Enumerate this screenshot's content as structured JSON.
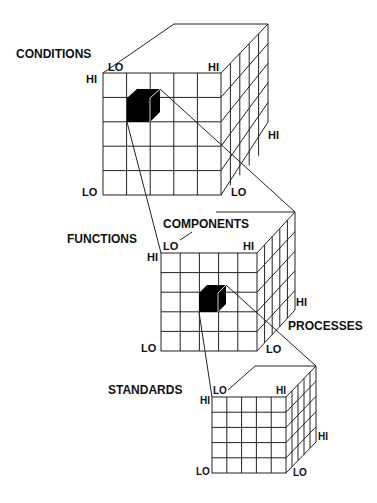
{
  "colors": {
    "line": "#222222",
    "fill": "#000000",
    "background": "#ffffff"
  },
  "cubes": [
    {
      "name": "top",
      "axes": {
        "front_left": "CONDITIONS"
      },
      "labels": {
        "front_top_left": "HI",
        "top_left": "LO",
        "top_right": "HI",
        "bottom_left": "LO",
        "bottom_right": "LO",
        "side_right": "HI"
      }
    },
    {
      "name": "middle",
      "axes": {
        "front_left": "FUNCTIONS",
        "top": "COMPONENTS",
        "side": "PROCESSES"
      },
      "labels": {
        "front_top_left": "HI",
        "top_left": "LO",
        "top_right": "HI",
        "bottom_left": "LO",
        "bottom_right": "LO",
        "side_right": "HI"
      }
    },
    {
      "name": "bottom",
      "axes": {
        "front_left": "STANDARDS"
      },
      "labels": {
        "front_top_left": "HI",
        "top_left": "LO",
        "top_right": "HI",
        "bottom_left": "LO",
        "bottom_right": "LO",
        "side_right": "HI"
      }
    }
  ]
}
